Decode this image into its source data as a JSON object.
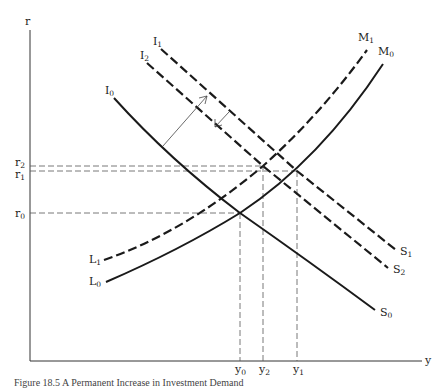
{
  "figure": {
    "caption": "Figure 18.5 A Permanent Increase in Investment Demand",
    "axes": {
      "y_axis_label": "r",
      "x_axis_label": "y"
    },
    "r_levels": [
      {
        "main": "r",
        "sub": "2"
      },
      {
        "main": "r",
        "sub": "1"
      },
      {
        "main": "r",
        "sub": "0"
      }
    ],
    "y_levels": [
      {
        "main": "y",
        "sub": "0"
      },
      {
        "main": "y",
        "sub": "2"
      },
      {
        "main": "y",
        "sub": "1"
      }
    ],
    "curves": {
      "I0": {
        "start_main": "I",
        "start_sub": "0",
        "end_main": "S",
        "end_sub": "0",
        "style": "solid"
      },
      "I1": {
        "start_main": "I",
        "start_sub": "1",
        "end_main": "S",
        "end_sub": "1",
        "style": "dashed"
      },
      "I2": {
        "start_main": "I",
        "start_sub": "2",
        "end_main": "S",
        "end_sub": "2",
        "style": "dashed"
      },
      "M0": {
        "start_main": "L",
        "start_sub": "0",
        "end_main": "M",
        "end_sub": "0",
        "style": "solid"
      },
      "M1": {
        "start_main": "L",
        "start_sub": "1",
        "end_main": "M",
        "end_sub": "1",
        "style": "dashed"
      }
    },
    "colors": {
      "ink": "#1a1a1a",
      "guide": "#555555",
      "background": "#ffffff"
    }
  }
}
